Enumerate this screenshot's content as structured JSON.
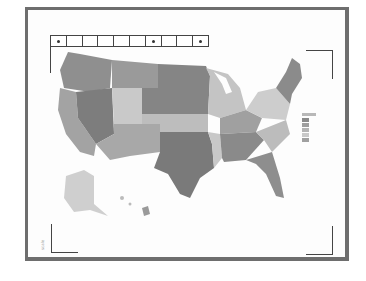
{
  "map": {
    "title": "US choropleth map",
    "region": "United States",
    "palette": {
      "darkest": "#7a7a7a",
      "dark": "#8d8d8d",
      "medium": "#a6a6a6",
      "light": "#c2c2c2",
      "lightest": "#d9d9d9"
    }
  },
  "toolbar": {
    "cells": [
      {
        "icon": "dot-icon"
      },
      {
        "icon": ""
      },
      {
        "icon": ""
      },
      {
        "icon": ""
      },
      {
        "icon": ""
      },
      {
        "icon": ""
      },
      {
        "icon": "dot-icon"
      },
      {
        "icon": ""
      },
      {
        "icon": ""
      },
      {
        "icon": "dot-icon"
      }
    ]
  },
  "legend": {
    "title": "legend",
    "swatches": [
      "#8a8a8a",
      "#9e9e9e",
      "#b4b4b4",
      "#c8c8c8",
      "#a0a0a0"
    ]
  },
  "scale_text": "scale"
}
